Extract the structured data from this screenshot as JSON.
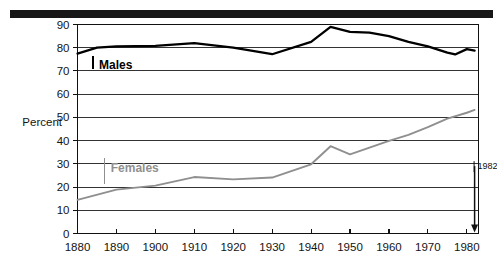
{
  "chart_data": {
    "type": "line",
    "title": "",
    "subtitle": "",
    "xlabel": "",
    "ylabel": "Percent",
    "xlim": [
      1880,
      1983
    ],
    "ylim": [
      0,
      90
    ],
    "ytick_labels": [
      "0",
      "10",
      "20",
      "30",
      "40",
      "50",
      "60",
      "70",
      "80",
      "90"
    ],
    "yticks": [
      0,
      10,
      20,
      30,
      40,
      50,
      60,
      70,
      80,
      90
    ],
    "xtick_labels": [
      "1880",
      "1890",
      "1900",
      "1910",
      "1920",
      "1930",
      "1940",
      "1950",
      "1960",
      "1970",
      "1980"
    ],
    "xticks": [
      1880,
      1890,
      1900,
      1910,
      1920,
      1930,
      1940,
      1950,
      1960,
      1970,
      1980
    ],
    "grid": "horizontal",
    "legend_position": "inline-labels",
    "series": [
      {
        "name": "Males",
        "color": "#000000",
        "label_x": 1884,
        "label_y": 72.5,
        "x": [
          1880,
          1885,
          1890,
          1900,
          1910,
          1920,
          1930,
          1940,
          1945,
          1950,
          1955,
          1960,
          1965,
          1970,
          1975,
          1977,
          1980,
          1982
        ],
        "values": [
          77.5,
          80.0,
          80.6,
          80.8,
          82.0,
          80.0,
          77.2,
          82.5,
          89.0,
          86.8,
          86.5,
          85.0,
          82.5,
          80.6,
          77.9,
          77.1,
          79.4,
          78.8
        ]
      },
      {
        "name": "Females",
        "color": "#8f8f8f",
        "label_x": 1887,
        "label_y": 28.0,
        "x": [
          1880,
          1890,
          1900,
          1910,
          1920,
          1930,
          1940,
          1945,
          1950,
          1960,
          1965,
          1970,
          1975,
          1980,
          1982
        ],
        "values": [
          14.5,
          18.9,
          20.6,
          24.3,
          23.3,
          24.1,
          29.8,
          37.6,
          34.1,
          39.9,
          42.5,
          45.8,
          49.5,
          52.0,
          53.2
        ]
      }
    ],
    "annotations": [
      {
        "name": "year-marker",
        "label": "1982",
        "x": 1982,
        "arrow": "down"
      }
    ]
  }
}
